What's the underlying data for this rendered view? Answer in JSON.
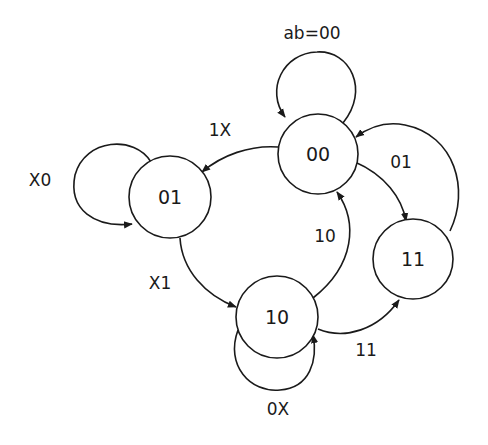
{
  "diagram": {
    "type": "state-transition",
    "input_legend": "ab=00",
    "states": [
      {
        "id": "s00",
        "label": "00"
      },
      {
        "id": "s01",
        "label": "01"
      },
      {
        "id": "s10",
        "label": "10"
      },
      {
        "id": "s11",
        "label": "11"
      }
    ],
    "transitions": [
      {
        "from": "00",
        "to": "00",
        "label": "ab=00"
      },
      {
        "from": "00",
        "to": "01",
        "label": "1X"
      },
      {
        "from": "01",
        "to": "01",
        "label": "X0"
      },
      {
        "from": "01",
        "to": "10",
        "label": "X1"
      },
      {
        "from": "10",
        "to": "10",
        "label": "0X"
      },
      {
        "from": "10",
        "to": "00",
        "label": "10"
      },
      {
        "from": "10",
        "to": "11",
        "label": "11"
      },
      {
        "from": "00",
        "to": "11",
        "label": "01"
      },
      {
        "from": "11",
        "to": "00",
        "label": ""
      }
    ]
  },
  "labels": {
    "self_00": "ab=00",
    "edge_00_01": "1X",
    "self_01": "X0",
    "edge_01_10": "X1",
    "self_10": "0X",
    "edge_10_00": "10",
    "edge_10_11": "11",
    "edge_00_11": "01"
  }
}
